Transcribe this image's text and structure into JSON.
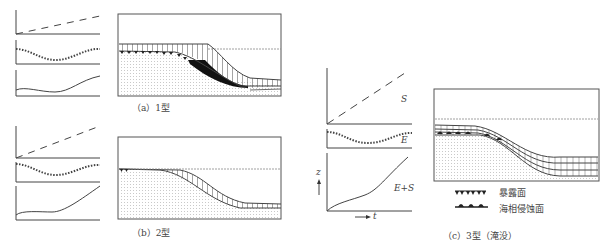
{
  "figure": {
    "panels": [
      {
        "id": "a",
        "caption": "（a）1型"
      },
      {
        "id": "b",
        "caption": "（b）2型"
      },
      {
        "id": "c",
        "caption": "（c）3型（淹没）"
      }
    ],
    "curve_labels": {
      "S": "S",
      "E": "E",
      "ES": "E+S",
      "z_axis": "z",
      "t_axis": "t"
    },
    "legend": [
      {
        "symbol": "exposure-surface",
        "label": "暴露面"
      },
      {
        "symbol": "marine-erosion-surface",
        "label": "海相侵蚀面"
      }
    ],
    "colors": {
      "line": "#444444",
      "fill_black": "#111111",
      "dots": "#999999"
    }
  }
}
